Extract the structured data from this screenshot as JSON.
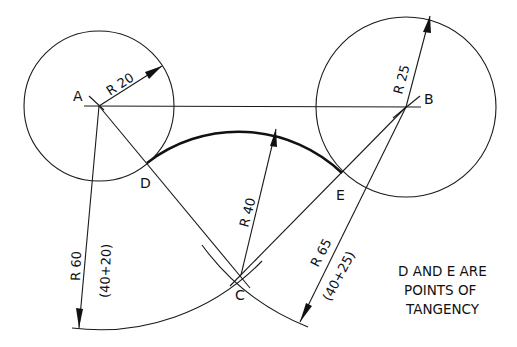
{
  "diagram": {
    "points": {
      "A": {
        "label": "A",
        "x": 99,
        "y": 106
      },
      "B": {
        "label": "B",
        "x": 406,
        "y": 107
      },
      "C": {
        "label": "C",
        "x": 241,
        "y": 275
      },
      "D": {
        "label": "D",
        "x": 147,
        "y": 163
      },
      "E": {
        "label": "E",
        "x": 342,
        "y": 173
      }
    },
    "circles": [
      {
        "center": "A",
        "radius_label": "R 20",
        "radius_px": 75
      },
      {
        "center": "B",
        "radius_label": "R 25",
        "radius_px": 90
      }
    ],
    "tangent_arc": {
      "center": "C",
      "radius_label": "R 40",
      "radius_px": 150
    },
    "construction_arcs": [
      {
        "center": "A",
        "radius_label": "R 60",
        "sum_label": "(40+20)"
      },
      {
        "center": "B",
        "radius_label": "R 65",
        "sum_label": "(40+25)"
      }
    ],
    "note": {
      "line1": "D AND E ARE",
      "line2": "POINTS OF",
      "line3": "TANGENCY"
    },
    "colors": {
      "ink": "#111111",
      "paper": "#ffffff"
    }
  }
}
